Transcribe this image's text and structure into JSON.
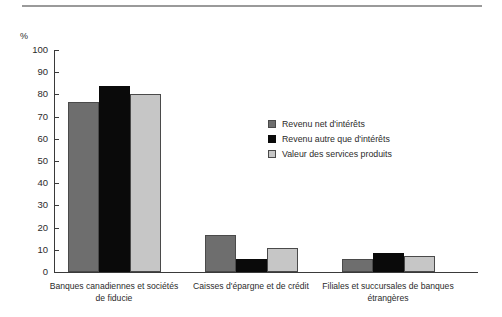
{
  "chart_data": {
    "type": "bar",
    "title": "",
    "subtitle": "",
    "xlabel": "",
    "ylabel": "%",
    "ylim": [
      0,
      100
    ],
    "yticks": [
      0,
      10,
      20,
      30,
      40,
      50,
      60,
      70,
      80,
      90,
      100
    ],
    "ytick_labels": [
      "0",
      "10",
      "20",
      "30",
      "40",
      "50",
      "60",
      "70",
      "80",
      "90",
      "100"
    ],
    "grid": false,
    "legend_position": "center-right",
    "categories": [
      "Banques canadiennes et sociétés de fiducie",
      "Caisses d'épargne et de crédit",
      "Filiales et succursales de banques étrangères"
    ],
    "category_lines": [
      [
        "Banques canadiennes et sociétés",
        "de fiducie"
      ],
      [
        "Caisses d'épargne et de crédit"
      ],
      [
        "Filiales et succursales de banques",
        "étrangères"
      ]
    ],
    "series": [
      {
        "name": "Revenu net d'intérêts",
        "color": "#6e6e6e",
        "values": [
          76.5,
          16.5,
          6.0
        ]
      },
      {
        "name": "Revenu autre que d'intérêts",
        "color": "#0a0a0a",
        "values": [
          84.0,
          6.0,
          8.5
        ]
      },
      {
        "name": "Valeur des services produits",
        "color": "#c6c6c6",
        "values": [
          80.0,
          11.0,
          7.0
        ]
      }
    ]
  },
  "axis": {
    "unit_label": "%"
  },
  "legend": {
    "items": [
      {
        "label": "Revenu net d'intérêts",
        "color": "#6e6e6e"
      },
      {
        "label": "Revenu autre que d'intérêts",
        "color": "#0a0a0a"
      },
      {
        "label": "Valeur des services produits",
        "color": "#c6c6c6"
      }
    ]
  }
}
